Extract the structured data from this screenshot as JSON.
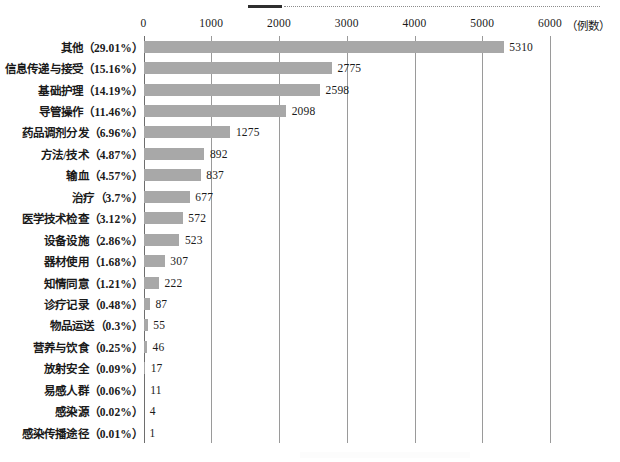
{
  "chart_data": {
    "type": "bar",
    "orientation": "horizontal",
    "title": "",
    "xlabel": "（例数）",
    "ylabel": "",
    "xlim": [
      0,
      6000
    ],
    "xticks": [
      0,
      1000,
      2000,
      3000,
      4000,
      5000,
      6000
    ],
    "xtick_labels": [
      "0",
      "1000",
      "2000",
      "3000",
      "4000",
      "5000",
      "6000"
    ],
    "grid": true,
    "legend": false,
    "bar_color": "#a8a8a8",
    "categories": [
      "其他（29.01%）",
      "信息传递与接受（15.16%）",
      "基础护理（14.19%）",
      "导管操作（11.46%）",
      "药品调剂分发（6.96%）",
      "方法/技术（4.87%）",
      "输血（4.57%）",
      "治疗（3.7%）",
      "医学技术检查（3.12%）",
      "设备设施（2.86%）",
      "器材使用（1.68%）",
      "知情同意（1.21%）",
      "诊疗记录（0.48%）",
      "物品运送（0.3%）",
      "营养与饮食（0.25%）",
      "放射安全（0.09%）",
      "易感人群（0.06%）",
      "感染源（0.02%）",
      "感染传播途径（0.01%）"
    ],
    "values": [
      5310,
      2775,
      2598,
      2098,
      1275,
      892,
      837,
      677,
      572,
      523,
      307,
      222,
      87,
      55,
      46,
      17,
      11,
      4,
      1
    ],
    "percentages": [
      "29.01%",
      "15.16%",
      "14.19%",
      "11.46%",
      "6.96%",
      "4.87%",
      "4.57%",
      "3.7%",
      "3.12%",
      "2.86%",
      "1.68%",
      "1.21%",
      "0.48%",
      "0.3%",
      "0.25%",
      "0.09%",
      "0.06%",
      "0.02%",
      "0.01%"
    ],
    "value_labels": [
      "5310",
      "2775",
      "2598",
      "2098",
      "1275",
      "892",
      "837",
      "677",
      "572",
      "523",
      "307",
      "222",
      "87",
      "55",
      "46",
      "17",
      "11",
      "4",
      "1"
    ]
  },
  "axis": {
    "unit_label": "（例数）"
  }
}
